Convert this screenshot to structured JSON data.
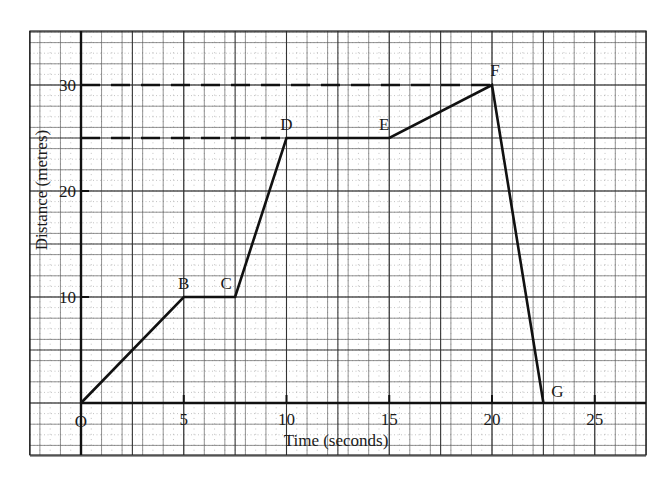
{
  "chart_data": {
    "type": "line",
    "title": "",
    "xlabel": "Time (seconds)",
    "ylabel": "Distance (metres)",
    "xlim": [
      -2.5,
      27.5
    ],
    "ylim": [
      -5,
      35
    ],
    "grid": true,
    "x_ticks": [
      5,
      10,
      15,
      20,
      25
    ],
    "y_ticks": [
      10,
      20,
      30
    ],
    "origin_label": "O",
    "series": [
      {
        "name": "distance-time",
        "points": [
          {
            "label": "O",
            "x": 0,
            "y": 0
          },
          {
            "label": "B",
            "x": 5,
            "y": 10
          },
          {
            "label": "C",
            "x": 7.5,
            "y": 10
          },
          {
            "label": "D",
            "x": 10,
            "y": 25
          },
          {
            "label": "E",
            "x": 15,
            "y": 25
          },
          {
            "label": "F",
            "x": 20,
            "y": 30
          },
          {
            "label": "G",
            "x": 22.5,
            "y": 0
          }
        ]
      }
    ],
    "annotations": [
      {
        "type": "dashed-hline",
        "y": 30,
        "from_x": 0,
        "to_x": 20
      },
      {
        "type": "dashed-hline",
        "y": 25,
        "from_x": 0,
        "to_x": 10
      }
    ],
    "legend": null
  },
  "labels": {
    "xlabel": "Time (seconds)",
    "ylabel": "Distance (metres)",
    "origin": "O",
    "x_ticks": [
      "5",
      "10",
      "15",
      "20",
      "25"
    ],
    "y_ticks": [
      "10",
      "20",
      "30"
    ]
  }
}
